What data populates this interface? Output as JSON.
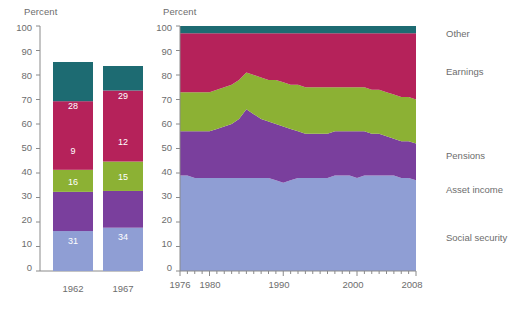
{
  "chart_data": [
    {
      "type": "bar",
      "id": "stacked-bar-panel",
      "title": "",
      "ylabel": "Percent",
      "xlabel": "",
      "ylim": [
        0,
        100
      ],
      "yticks": [
        0,
        10,
        20,
        30,
        40,
        50,
        60,
        70,
        80,
        90,
        100
      ],
      "grid": false,
      "stacked": true,
      "categories": [
        "1962",
        "1967"
      ],
      "series": [
        {
          "name": "Social security",
          "color": "#8f9ed4",
          "values": [
            31,
            34
          ]
        },
        {
          "name": "Asset income",
          "color": "#7a3f9d",
          "values": [
            16,
            15
          ]
        },
        {
          "name": "Pensions",
          "color": "#8cb134",
          "values": [
            9,
            12
          ]
        },
        {
          "name": "Earnings",
          "color": "#b5225a",
          "values": [
            28,
            29
          ]
        },
        {
          "name": "Other",
          "color": "#1d6b72",
          "values": [
            16,
            10
          ]
        }
      ]
    },
    {
      "type": "area",
      "id": "stacked-area-panel",
      "title": "",
      "ylabel": "Percent",
      "xlabel": "",
      "ylim": [
        0,
        100
      ],
      "yticks": [
        0,
        10,
        20,
        30,
        40,
        50,
        60,
        70,
        80,
        90,
        100
      ],
      "xlim": [
        1976,
        2008
      ],
      "xticks": [
        1976,
        1980,
        1990,
        2000,
        2008
      ],
      "xtick_labels": [
        "1976",
        "1980",
        "1990",
        "2000",
        "2008"
      ],
      "minor_xticks_every": 1,
      "grid": false,
      "stacked": true,
      "legend_position": "right",
      "x": [
        1976,
        1977,
        1978,
        1979,
        1980,
        1981,
        1982,
        1983,
        1984,
        1985,
        1986,
        1987,
        1988,
        1989,
        1990,
        1991,
        1992,
        1993,
        1994,
        1995,
        1996,
        1997,
        1998,
        1999,
        2000,
        2001,
        2002,
        2003,
        2004,
        2005,
        2006,
        2007,
        2008
      ],
      "series": [
        {
          "name": "Social security",
          "color": "#8f9ed4",
          "values": [
            39,
            39,
            38,
            38,
            38,
            38,
            38,
            38,
            38,
            38,
            38,
            38,
            38,
            37,
            36,
            37,
            38,
            38,
            38,
            38,
            38,
            39,
            39,
            39,
            38,
            39,
            39,
            39,
            39,
            39,
            38,
            38,
            37
          ]
        },
        {
          "name": "Asset income",
          "color": "#7a3f9d",
          "values": [
            18,
            18,
            19,
            19,
            19,
            20,
            21,
            22,
            24,
            28,
            26,
            24,
            23,
            23,
            23,
            21,
            19,
            18,
            18,
            18,
            18,
            18,
            18,
            18,
            19,
            18,
            17,
            17,
            16,
            15,
            15,
            15,
            15
          ]
        },
        {
          "name": "Pensions",
          "color": "#8cb134",
          "values": [
            16,
            16,
            16,
            16,
            16,
            16,
            16,
            16,
            16,
            15,
            16,
            17,
            17,
            18,
            18,
            18,
            19,
            19,
            19,
            19,
            19,
            18,
            18,
            18,
            18,
            18,
            18,
            18,
            18,
            18,
            18,
            18,
            18
          ]
        },
        {
          "name": "Earnings",
          "color": "#b5225a",
          "values": [
            24,
            24,
            24,
            24,
            24,
            23,
            22,
            21,
            19,
            16,
            17,
            18,
            19,
            19,
            20,
            21,
            21,
            22,
            22,
            22,
            22,
            22,
            22,
            22,
            22,
            22,
            23,
            23,
            24,
            25,
            26,
            26,
            27
          ]
        },
        {
          "name": "Other",
          "color": "#1d6b72",
          "values": [
            3,
            3,
            3,
            3,
            3,
            3,
            3,
            3,
            3,
            3,
            3,
            3,
            3,
            3,
            3,
            3,
            3,
            3,
            3,
            3,
            3,
            3,
            3,
            3,
            3,
            3,
            3,
            3,
            3,
            3,
            3,
            3,
            3
          ]
        }
      ]
    }
  ],
  "left_panel": {
    "ylabel": "Percent",
    "yticks": [
      "100",
      "90",
      "80",
      "70",
      "60",
      "50",
      "40",
      "30",
      "20",
      "10",
      "0"
    ],
    "bars": [
      {
        "category": "1962",
        "segments": [
          {
            "label": "Other",
            "value": "16"
          },
          {
            "label": "Earnings",
            "value": "28"
          },
          {
            "label": "Pensions",
            "value": "9"
          },
          {
            "label": "Asset income",
            "value": "16"
          },
          {
            "label": "Social security",
            "value": "31"
          }
        ]
      },
      {
        "category": "1967",
        "segments": [
          {
            "label": "Other",
            "value": "10"
          },
          {
            "label": "Earnings",
            "value": "29"
          },
          {
            "label": "Pensions",
            "value": "12"
          },
          {
            "label": "Asset income",
            "value": "15"
          },
          {
            "label": "Social security",
            "value": "34"
          }
        ]
      }
    ]
  },
  "right_panel": {
    "ylabel": "Percent",
    "yticks": [
      "100",
      "90",
      "80",
      "70",
      "60",
      "50",
      "40",
      "30",
      "20",
      "10",
      "0"
    ],
    "xticks": [
      "1976",
      "1980",
      "1990",
      "2000",
      "2008"
    ]
  },
  "legend": {
    "items": [
      {
        "label": "Other",
        "color": "#1d6b72"
      },
      {
        "label": "Earnings",
        "color": "#b5225a"
      },
      {
        "label": "Pensions",
        "color": "#8cb134"
      },
      {
        "label": "Asset income",
        "color": "#7a3f9d"
      },
      {
        "label": "Social security",
        "color": "#8f9ed4"
      }
    ]
  },
  "colors": {
    "other": "#1d6b72",
    "earnings": "#b5225a",
    "pensions": "#8cb134",
    "asset_income": "#7a3f9d",
    "social_security": "#8f9ed4",
    "axis": "#8a8a8a",
    "text": "#6d6d6d"
  }
}
